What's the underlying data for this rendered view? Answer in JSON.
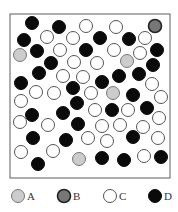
{
  "diagram": {
    "type": "particle-mixture",
    "box": {
      "x": 10,
      "y": 14,
      "width": 160,
      "height": 164,
      "stroke": "#777777"
    },
    "radius": 6.5,
    "styles": {
      "A": {
        "fill": "#cccccc",
        "stroke": "#777777"
      },
      "B": {
        "fill": "#777777",
        "stroke": "#222222"
      },
      "C": {
        "fill": "#ffffff",
        "stroke": "#555555"
      },
      "D": {
        "fill": "#0a0a0a",
        "stroke": "#0a0a0a"
      }
    },
    "particles": [
      {
        "t": "D",
        "x": 32,
        "y": 23
      },
      {
        "t": "D",
        "x": 59,
        "y": 27
      },
      {
        "t": "C",
        "x": 86,
        "y": 26
      },
      {
        "t": "C",
        "x": 116,
        "y": 27
      },
      {
        "t": "B",
        "x": 155,
        "y": 26
      },
      {
        "t": "D",
        "x": 24,
        "y": 40
      },
      {
        "t": "C",
        "x": 47,
        "y": 37
      },
      {
        "t": "C",
        "x": 73,
        "y": 38
      },
      {
        "t": "D",
        "x": 100,
        "y": 38
      },
      {
        "t": "D",
        "x": 129,
        "y": 39
      },
      {
        "t": "C",
        "x": 145,
        "y": 38
      },
      {
        "t": "A",
        "x": 20,
        "y": 55
      },
      {
        "t": "D",
        "x": 37,
        "y": 51
      },
      {
        "t": "C",
        "x": 60,
        "y": 50
      },
      {
        "t": "D",
        "x": 86,
        "y": 50
      },
      {
        "t": "C",
        "x": 114,
        "y": 50
      },
      {
        "t": "C",
        "x": 140,
        "y": 53
      },
      {
        "t": "D",
        "x": 157,
        "y": 50
      },
      {
        "t": "D",
        "x": 51,
        "y": 63
      },
      {
        "t": "C",
        "x": 74,
        "y": 62
      },
      {
        "t": "C",
        "x": 97,
        "y": 63
      },
      {
        "t": "A",
        "x": 127,
        "y": 61
      },
      {
        "t": "D",
        "x": 153,
        "y": 65
      },
      {
        "t": "D",
        "x": 39,
        "y": 73
      },
      {
        "t": "C",
        "x": 63,
        "y": 76
      },
      {
        "t": "C",
        "x": 83,
        "y": 77
      },
      {
        "t": "D",
        "x": 102,
        "y": 82
      },
      {
        "t": "D",
        "x": 119,
        "y": 76
      },
      {
        "t": "D",
        "x": 139,
        "y": 74
      },
      {
        "t": "C",
        "x": 152,
        "y": 84
      },
      {
        "t": "D",
        "x": 21,
        "y": 83
      },
      {
        "t": "C",
        "x": 36,
        "y": 92
      },
      {
        "t": "C",
        "x": 54,
        "y": 93
      },
      {
        "t": "D",
        "x": 73,
        "y": 88
      },
      {
        "t": "C",
        "x": 91,
        "y": 93
      },
      {
        "t": "A",
        "x": 113,
        "y": 93
      },
      {
        "t": "D",
        "x": 133,
        "y": 95
      },
      {
        "t": "C",
        "x": 161,
        "y": 97
      },
      {
        "t": "C",
        "x": 21,
        "y": 101
      },
      {
        "t": "D",
        "x": 77,
        "y": 103
      },
      {
        "t": "C",
        "x": 95,
        "y": 110
      },
      {
        "t": "D",
        "x": 112,
        "y": 110
      },
      {
        "t": "C",
        "x": 128,
        "y": 110
      },
      {
        "t": "D",
        "x": 147,
        "y": 108
      },
      {
        "t": "C",
        "x": 159,
        "y": 118
      },
      {
        "t": "D",
        "x": 32,
        "y": 115
      },
      {
        "t": "D",
        "x": 63,
        "y": 113
      },
      {
        "t": "C",
        "x": 20,
        "y": 122
      },
      {
        "t": "C",
        "x": 48,
        "y": 125
      },
      {
        "t": "D",
        "x": 78,
        "y": 124
      },
      {
        "t": "C",
        "x": 102,
        "y": 126
      },
      {
        "t": "C",
        "x": 120,
        "y": 125
      },
      {
        "t": "C",
        "x": 143,
        "y": 127
      },
      {
        "t": "C",
        "x": 158,
        "y": 138
      },
      {
        "t": "D",
        "x": 33,
        "y": 138
      },
      {
        "t": "D",
        "x": 66,
        "y": 140
      },
      {
        "t": "C",
        "x": 88,
        "y": 138
      },
      {
        "t": "C",
        "x": 107,
        "y": 141
      },
      {
        "t": "D",
        "x": 133,
        "y": 137
      },
      {
        "t": "C",
        "x": 21,
        "y": 152
      },
      {
        "t": "C",
        "x": 53,
        "y": 151
      },
      {
        "t": "A",
        "x": 79,
        "y": 159
      },
      {
        "t": "D",
        "x": 102,
        "y": 158
      },
      {
        "t": "D",
        "x": 124,
        "y": 160
      },
      {
        "t": "C",
        "x": 144,
        "y": 156
      },
      {
        "t": "D",
        "x": 161,
        "y": 157
      },
      {
        "t": "D",
        "x": 38,
        "y": 164
      }
    ],
    "legend": [
      {
        "t": "A",
        "label": "A",
        "x": 18,
        "y": 196
      },
      {
        "t": "B",
        "label": "B",
        "x": 64,
        "y": 196
      },
      {
        "t": "C",
        "label": "C",
        "x": 110,
        "y": 196
      },
      {
        "t": "D",
        "label": "D",
        "x": 155,
        "y": 196
      }
    ]
  }
}
